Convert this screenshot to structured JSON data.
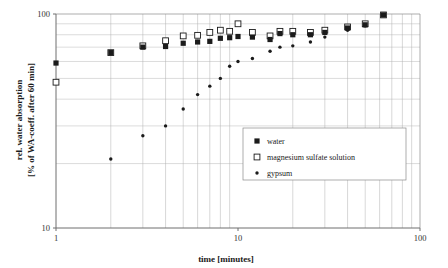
{
  "chart_data": {
    "type": "scatter",
    "title": "",
    "xlabel": "time [minutes]",
    "ylabel": "rel. water absorption [% of WA-coeff. after 60 min]",
    "ylabel_line1": "rel. water absorption",
    "ylabel_line2": "[% of WA-coeff. after 60 min]",
    "xscale": "log",
    "yscale": "log",
    "xlim": [
      1,
      100
    ],
    "ylim": [
      10,
      100
    ],
    "grid": true,
    "x_tick_labels": [
      "1",
      "10",
      "100"
    ],
    "x_ticks": [
      1,
      10,
      100
    ],
    "y_tick_labels": [
      "10",
      "100"
    ],
    "y_ticks": [
      10,
      100
    ],
    "y_minor_gridlines": [
      20,
      30,
      40,
      50,
      60,
      70,
      80,
      90
    ],
    "x_minor_gridlines": [
      2,
      3,
      4,
      5,
      6,
      7,
      8,
      9,
      20,
      30,
      40,
      50,
      60,
      70,
      80,
      90
    ],
    "legend_position": "center-right",
    "series": [
      {
        "name": "water",
        "marker": "filled-square",
        "color": "#1b1b1b",
        "points": [
          [
            1,
            59
          ],
          [
            2,
            66
          ],
          [
            3,
            70
          ],
          [
            4,
            70.5
          ],
          [
            5,
            73
          ],
          [
            6,
            74
          ],
          [
            7,
            74.5
          ],
          [
            8,
            77
          ],
          [
            9,
            77.5
          ],
          [
            10,
            78.5
          ],
          [
            12,
            78
          ],
          [
            15,
            76
          ],
          [
            17,
            81
          ],
          [
            20,
            80
          ],
          [
            25,
            80
          ],
          [
            30,
            82
          ],
          [
            40,
            86
          ],
          [
            50,
            89
          ],
          [
            63,
            99
          ]
        ]
      },
      {
        "name": "magnesium sulfate solution",
        "marker": "open-square",
        "color": "#ffffff",
        "points": [
          [
            1,
            48
          ],
          [
            2,
            66
          ],
          [
            3,
            71
          ],
          [
            4,
            75
          ],
          [
            5,
            79
          ],
          [
            6,
            79.5
          ],
          [
            7,
            82
          ],
          [
            8,
            84
          ],
          [
            9,
            83
          ],
          [
            10,
            90
          ],
          [
            12,
            82
          ],
          [
            15,
            79
          ],
          [
            17,
            83
          ],
          [
            20,
            83
          ],
          [
            25,
            82
          ],
          [
            30,
            84
          ],
          [
            40,
            87
          ],
          [
            50,
            90
          ],
          [
            63,
            99
          ]
        ]
      },
      {
        "name": "gypsum",
        "marker": "small-dot",
        "color": "#1b1b1b",
        "points": [
          [
            2,
            21
          ],
          [
            3,
            27
          ],
          [
            4,
            30
          ],
          [
            5,
            36
          ],
          [
            6,
            42
          ],
          [
            7,
            46
          ],
          [
            8,
            50
          ],
          [
            9,
            57
          ],
          [
            10,
            60
          ],
          [
            12,
            62
          ],
          [
            15,
            67
          ],
          [
            17,
            70
          ],
          [
            20,
            71
          ],
          [
            25,
            74
          ],
          [
            30,
            78
          ],
          [
            40,
            84
          ],
          [
            50,
            88
          ],
          [
            63,
            99
          ]
        ]
      }
    ]
  },
  "legend": {
    "items": [
      {
        "label": "water",
        "marker": "filled-square"
      },
      {
        "label": "magnesium sulfate solution",
        "marker": "open-square"
      },
      {
        "label": "gypsum",
        "marker": "small-dot"
      }
    ]
  }
}
